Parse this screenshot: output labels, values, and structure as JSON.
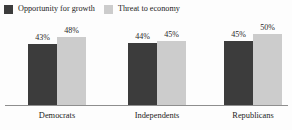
{
  "chart_data": {
    "type": "bar",
    "title": "",
    "subtitle": "",
    "xlabel": "",
    "ylabel": "",
    "ylim": [
      0,
      60
    ],
    "grid": false,
    "legend_position": "top-left",
    "categories": [
      "Democrats",
      "Independents",
      "Republicans"
    ],
    "series": [
      {
        "name": "Opportunity for growth",
        "color": "#3c3c3c",
        "values": [
          43,
          48,
          45
        ],
        "labels": [
          "43%",
          "45%",
          "45%"
        ]
      },
      {
        "name": "Threat to economy",
        "color": "#cccccc",
        "values": [
          48,
          45,
          50
        ],
        "labels": [
          "48%",
          "45%",
          "50%"
        ]
      }
    ],
    "groups": [
      {
        "category": "Democrats",
        "bars": [
          {
            "series": "Opportunity for growth",
            "value": 43,
            "label": "43%",
            "color": "#3c3c3c"
          },
          {
            "series": "Threat to economy",
            "value": 48,
            "label": "48%",
            "color": "#cccccc"
          }
        ]
      },
      {
        "category": "Independents",
        "bars": [
          {
            "series": "Opportunity for growth",
            "value": 44,
            "label": "44%",
            "color": "#3c3c3c"
          },
          {
            "series": "Threat to economy",
            "value": 45,
            "label": "45%",
            "color": "#cccccc"
          }
        ]
      },
      {
        "category": "Republicans",
        "bars": [
          {
            "series": "Opportunity for growth",
            "value": 45,
            "label": "45%",
            "color": "#3c3c3c"
          },
          {
            "series": "Threat to economy",
            "value": 50,
            "label": "50%",
            "color": "#cccccc"
          }
        ]
      }
    ]
  },
  "legend": {
    "items": [
      {
        "label": "Opportunity for growth",
        "color": "#3c3c3c"
      },
      {
        "label": "Threat to economy",
        "color": "#cccccc"
      }
    ]
  },
  "axis": {
    "baseline_color": "#8e8e8e"
  },
  "background": "#fdfdfd"
}
